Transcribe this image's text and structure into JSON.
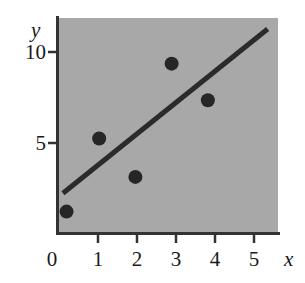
{
  "chart_data": {
    "type": "scatter",
    "title": "",
    "xlabel": "x",
    "ylabel": "y",
    "x": [
      0.1,
      1,
      2,
      3,
      4
    ],
    "y": [
      1.2,
      5.2,
      3.1,
      9.3,
      7.3
    ],
    "points": [
      {
        "x": 0.1,
        "y": 1.2
      },
      {
        "x": 1,
        "y": 5.2
      },
      {
        "x": 2,
        "y": 3.1
      },
      {
        "x": 3,
        "y": 9.3
      },
      {
        "x": 4,
        "y": 7.3
      }
    ],
    "series": [
      {
        "name": "data points",
        "type": "scatter",
        "x": [
          0.1,
          1,
          2,
          3,
          4
        ],
        "values": [
          1.2,
          5.2,
          3.1,
          9.3,
          7.3
        ]
      },
      {
        "name": "fitted line",
        "type": "line",
        "x": [
          0,
          5.65
        ],
        "values": [
          2.2,
          11.2
        ],
        "slope": 1.6,
        "intercept": 2.2
      }
    ],
    "xlim": [
      -0.15,
      5.95
    ],
    "ylim": [
      0,
      11.8
    ],
    "xticks": [
      0,
      1,
      2,
      3,
      4,
      5
    ],
    "xtick_labels": [
      "0",
      "1",
      "2",
      "3",
      "4",
      "5"
    ],
    "yticks": [
      5,
      10
    ],
    "ytick_labels": [
      "5",
      "10"
    ],
    "grid": false,
    "legend": null,
    "plot_background_color": "#a8a8a8",
    "figure_background_color": "#ffffff",
    "marker_color": "#262626",
    "line_color": "#2b2b2b",
    "axis_color": "#333333",
    "text_color": "#1a1a1a"
  }
}
